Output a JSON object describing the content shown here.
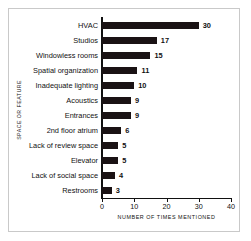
{
  "chart_data": {
    "type": "bar",
    "orientation": "horizontal",
    "title": "",
    "xlabel": "NUMBER OF TIMES MENTIONED",
    "ylabel": "SPACE OR FEATURE",
    "xlim": [
      0,
      40
    ],
    "xticks": [
      0,
      10,
      20,
      30,
      40
    ],
    "xticklabels": [
      "0",
      "10",
      "20",
      "30",
      "40"
    ],
    "grid": false,
    "legend": false,
    "bar_color": "#1a1214",
    "categories": [
      "HVAC",
      "Studios",
      "Windowless rooms",
      "Spatial organization",
      "Inadequate lighting",
      "Acoustics",
      "Entrances",
      "2nd floor atrium",
      "Lack of review space",
      "Elevator",
      "Lack of social space",
      "Restrooms"
    ],
    "values": [
      30,
      17,
      15,
      11,
      10,
      9,
      9,
      6,
      5,
      5,
      4,
      3
    ],
    "value_labels": [
      "30",
      "17",
      "15",
      "11",
      "10",
      "9",
      "9",
      "6",
      "5",
      "5",
      "4",
      "3"
    ]
  }
}
